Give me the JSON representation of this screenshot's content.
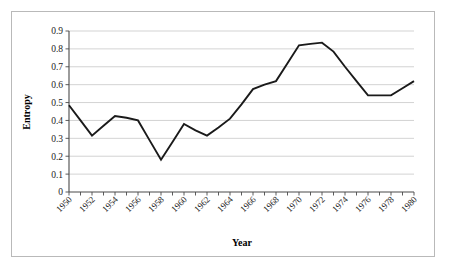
{
  "figure": {
    "border_color": "#b9b9b9",
    "background": "#ffffff"
  },
  "chart_data": {
    "type": "line",
    "title": "",
    "subtitle": "",
    "xlabel": "Year",
    "ylabel": "Entropy",
    "xlim": [
      1950,
      1980
    ],
    "ylim": [
      0,
      0.9
    ],
    "grid": true,
    "legend": false,
    "legend_position": "none",
    "line_color": "#1a1a1a",
    "ytick_labels": [
      "0.9",
      "0.8",
      "0.7",
      "0.6",
      "0.5",
      "0.4",
      "0.3",
      "0.2",
      "0.1",
      "0"
    ],
    "ytick_values": [
      0.9,
      0.8,
      0.7,
      0.6,
      0.5,
      0.4,
      0.3,
      0.2,
      0.1,
      0
    ],
    "xtick_labels": [
      "1950",
      "1952",
      "1954",
      "1956",
      "1958",
      "1960",
      "1962",
      "1964",
      "1966",
      "1968",
      "1970",
      "1972",
      "1974",
      "1976",
      "1978",
      "1980"
    ],
    "xtick_values": [
      1950,
      1952,
      1954,
      1956,
      1958,
      1960,
      1962,
      1964,
      1966,
      1968,
      1970,
      1972,
      1974,
      1976,
      1978,
      1980
    ],
    "minor_ticks_every": 1,
    "x": [
      1950,
      1951,
      1952,
      1953,
      1954,
      1955,
      1956,
      1957,
      1958,
      1959,
      1960,
      1961,
      1962,
      1963,
      1964,
      1965,
      1966,
      1967,
      1968,
      1969,
      1970,
      1971,
      1972,
      1973,
      1974,
      1975,
      1976,
      1977,
      1978,
      1979,
      1980
    ],
    "values": [
      0.485,
      0.4,
      0.315,
      0.37,
      0.425,
      0.415,
      0.4,
      0.29,
      0.18,
      0.28,
      0.38,
      0.345,
      0.315,
      0.36,
      0.41,
      0.49,
      0.575,
      0.6,
      0.62,
      0.72,
      0.82,
      0.828,
      0.835,
      0.785,
      0.7,
      0.62,
      0.54,
      0.54,
      0.54,
      0.58,
      0.62
    ],
    "series": [
      {
        "name": "Entropy",
        "values": [
          0.485,
          0.4,
          0.315,
          0.37,
          0.425,
          0.415,
          0.4,
          0.29,
          0.18,
          0.28,
          0.38,
          0.345,
          0.315,
          0.36,
          0.41,
          0.49,
          0.575,
          0.6,
          0.62,
          0.72,
          0.82,
          0.828,
          0.835,
          0.785,
          0.7,
          0.62,
          0.54,
          0.54,
          0.54,
          0.58,
          0.62
        ]
      }
    ],
    "annotations": []
  }
}
